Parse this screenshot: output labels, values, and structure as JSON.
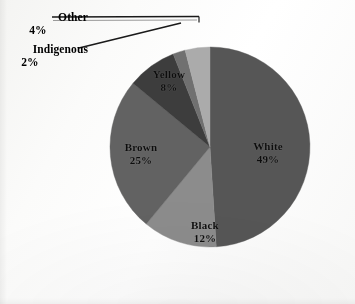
{
  "chart_data": {
    "type": "pie",
    "title": "",
    "subtitle": "",
    "xlabel": "",
    "ylabel": "",
    "legend_position": "none",
    "grid": false,
    "units": "percent",
    "total": 100,
    "start_angle_deg": 0,
    "direction": "clockwise",
    "categories": [
      "White",
      "Black",
      "Brown",
      "Yellow",
      "Indigenous",
      "Other"
    ],
    "values": [
      49,
      12,
      25,
      8,
      2,
      4
    ],
    "slices": [
      {
        "label": "White",
        "value": 49,
        "value_text": "49%",
        "color": "#565656",
        "label_placement": "inside",
        "start_deg": 0,
        "end_deg": 176.4
      },
      {
        "label": "Black",
        "value": 12,
        "value_text": "12%",
        "color": "#8c8c8c",
        "label_placement": "inside",
        "start_deg": 176.4,
        "end_deg": 219.6
      },
      {
        "label": "Brown",
        "value": 25,
        "value_text": "25%",
        "color": "#626262",
        "label_placement": "inside",
        "start_deg": 219.6,
        "end_deg": 309.6
      },
      {
        "label": "Yellow",
        "value": 8,
        "value_text": "8%",
        "color": "#3d3d3d",
        "label_placement": "inside",
        "start_deg": 309.6,
        "end_deg": 338.4
      },
      {
        "label": "Indigenous",
        "value": 2,
        "value_text": "2%",
        "color": "#707070",
        "label_placement": "callout",
        "start_deg": 338.4,
        "end_deg": 345.6
      },
      {
        "label": "Other",
        "value": 4,
        "value_text": "4%",
        "color": "#ababab",
        "label_placement": "callout",
        "start_deg": 345.6,
        "end_deg": 360
      }
    ]
  },
  "colors": {
    "background": "#fdfdfc",
    "text": "#0d0d0d",
    "leader_line": "#1a1a1a"
  }
}
